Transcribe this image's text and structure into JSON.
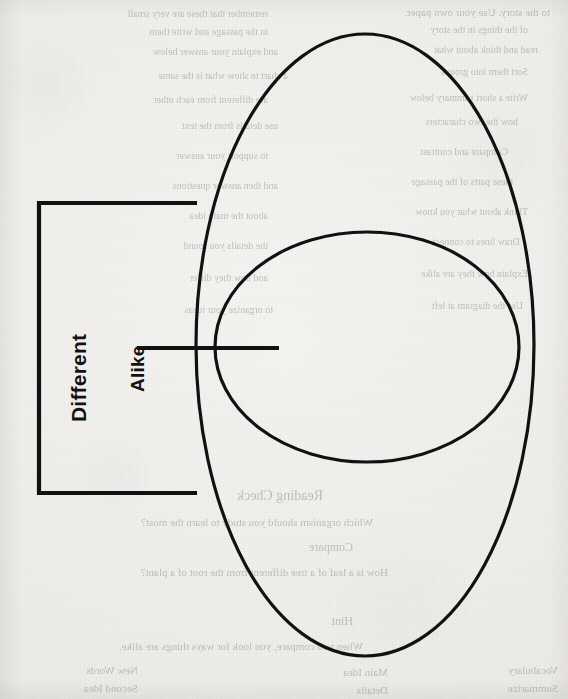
{
  "document": {
    "type": "venn-diagram-worksheet",
    "page_background": "#f1f0ee",
    "ink_color": "#111111"
  },
  "diagram": {
    "title": "",
    "labels": {
      "different": "Different",
      "alike": "Alike"
    },
    "shapes": [
      {
        "name": "outer-ellipse",
        "kind": "ellipse",
        "cx": 365,
        "cy": 345,
        "rx": 169,
        "ry": 311,
        "stroke": "#111111",
        "stroke_width": 3.2,
        "fill": "none"
      },
      {
        "name": "inner-ellipse",
        "kind": "ellipse",
        "cx": 367,
        "cy": 347,
        "rx": 152,
        "ry": 115,
        "stroke": "#111111",
        "stroke_width": 3.2,
        "fill": "none"
      }
    ],
    "annotations": [
      {
        "name": "different-bracket",
        "kind": "bracket",
        "points": "197,203 39,203 39,493 197,493",
        "stroke": "#111111",
        "stroke_width": 4.2
      },
      {
        "name": "alike-leader-line",
        "kind": "line",
        "x1": 137,
        "y1": 348,
        "x2": 279,
        "y2": 348,
        "stroke": "#111111",
        "stroke_width": 4.2
      }
    ],
    "intersections": [
      {
        "name": "left-crossing",
        "x": 215,
        "y": 348
      },
      {
        "name": "right-crossing",
        "x": 519,
        "y": 348
      }
    ]
  },
  "bleedthrough": {
    "note": "faint mirrored text showing through from the reverse side of the scanned page",
    "lines": [
      {
        "text": "to the story. Use your own paper.",
        "x": 18,
        "y": 6,
        "size": 11
      },
      {
        "text": "remember that these are very small",
        "x": 300,
        "y": 8,
        "size": 10
      },
      {
        "text": "of the things in the story",
        "x": 40,
        "y": 24,
        "size": 10
      },
      {
        "text": "in the passage and write them",
        "x": 300,
        "y": 26,
        "size": 10
      },
      {
        "text": "read and think about what",
        "x": 30,
        "y": 44,
        "size": 10
      },
      {
        "text": "and explain your answer below",
        "x": 290,
        "y": 46,
        "size": 10
      },
      {
        "text": "Sort them into groups",
        "x": 40,
        "y": 66,
        "size": 10
      },
      {
        "text": "a chart to show what is the same",
        "x": 280,
        "y": 70,
        "size": 10
      },
      {
        "text": "Write a short summary below",
        "x": 40,
        "y": 92,
        "size": 10
      },
      {
        "text": "are different from each other",
        "x": 300,
        "y": 94,
        "size": 10
      },
      {
        "text": "how the two characters",
        "x": 50,
        "y": 116,
        "size": 10
      },
      {
        "text": "use details from the text",
        "x": 290,
        "y": 120,
        "size": 10
      },
      {
        "text": "Compare and contrast",
        "x": 60,
        "y": 146,
        "size": 10
      },
      {
        "text": "to support your answer",
        "x": 300,
        "y": 150,
        "size": 10
      },
      {
        "text": "these parts of the passage",
        "x": 55,
        "y": 176,
        "size": 10
      },
      {
        "text": "and then answer questions",
        "x": 290,
        "y": 180,
        "size": 10
      },
      {
        "text": "Think about what you know",
        "x": 40,
        "y": 206,
        "size": 10
      },
      {
        "text": "about the main idea",
        "x": 300,
        "y": 210,
        "size": 10
      },
      {
        "text": "Draw lines to connect",
        "x": 48,
        "y": 236,
        "size": 10
      },
      {
        "text": "the details you found",
        "x": 300,
        "y": 240,
        "size": 10
      },
      {
        "text": "Explain how they are alike",
        "x": 40,
        "y": 268,
        "size": 10
      },
      {
        "text": "and how they differ",
        "x": 300,
        "y": 272,
        "size": 10
      },
      {
        "text": "Use the diagram at left",
        "x": 45,
        "y": 300,
        "size": 10
      },
      {
        "text": "to organize your ideas",
        "x": 295,
        "y": 304,
        "size": 10
      },
      {
        "text": "Reading Check",
        "x": 245,
        "y": 488,
        "size": 14
      },
      {
        "text": "Which organism should you study to learn the most?",
        "x": 195,
        "y": 516,
        "size": 11
      },
      {
        "text": "Compare",
        "x": 215,
        "y": 540,
        "size": 12
      },
      {
        "text": "How is a leaf of a tree different from the root of a plant?",
        "x": 180,
        "y": 566,
        "size": 11
      },
      {
        "text": "Hint",
        "x": 215,
        "y": 614,
        "size": 12
      },
      {
        "text": "When you compare, you look for ways things are alike.",
        "x": 205,
        "y": 640,
        "size": 11
      },
      {
        "text": "Vocabulary",
        "x": 10,
        "y": 664,
        "size": 11
      },
      {
        "text": "Main Idea",
        "x": 180,
        "y": 666,
        "size": 11
      },
      {
        "text": "New Words",
        "x": 430,
        "y": 664,
        "size": 11
      },
      {
        "text": "Summarize",
        "x": 10,
        "y": 682,
        "size": 11
      },
      {
        "text": "Details",
        "x": 180,
        "y": 684,
        "size": 11
      },
      {
        "text": "Second Idea",
        "x": 430,
        "y": 682,
        "size": 11
      }
    ]
  }
}
